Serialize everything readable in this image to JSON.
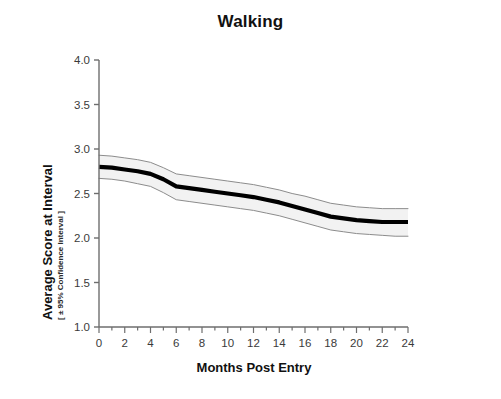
{
  "chart_data": {
    "type": "line",
    "title": "Walking",
    "xlabel": "Months Post Entry",
    "ylabel": "Average Score at Interval",
    "ylabel_sub": "[ ± 95% Confidence Interval ]",
    "xlim": [
      0,
      24
    ],
    "ylim": [
      1.0,
      4.0
    ],
    "xticks": [
      0,
      2,
      4,
      6,
      8,
      10,
      12,
      14,
      16,
      18,
      20,
      22,
      24
    ],
    "xtick_labels": [
      "0",
      "2",
      "4",
      "6",
      "8",
      "10",
      "12",
      "14",
      "16",
      "18",
      "20",
      "22",
      "24"
    ],
    "yticks": [
      1.0,
      1.5,
      2.0,
      2.5,
      3.0,
      3.5,
      4.0
    ],
    "ytick_labels": [
      "1.0",
      "1.5",
      "2.0",
      "2.5",
      "3.0",
      "3.5",
      "4.0"
    ],
    "x_minor_tick_step": 1,
    "grid": false,
    "legend": "none",
    "x": [
      0,
      1,
      2,
      3,
      4,
      5,
      6,
      7,
      8,
      9,
      10,
      11,
      12,
      13,
      14,
      15,
      16,
      17,
      18,
      19,
      20,
      21,
      22,
      23,
      24
    ],
    "series": [
      {
        "name": "Average Score at Interval",
        "style": "solid-thick-black",
        "color": "#000000",
        "values": [
          2.8,
          2.79,
          2.77,
          2.75,
          2.72,
          2.66,
          2.58,
          2.56,
          2.54,
          2.52,
          2.5,
          2.48,
          2.46,
          2.43,
          2.4,
          2.36,
          2.32,
          2.28,
          2.24,
          2.22,
          2.2,
          2.19,
          2.18,
          2.18,
          2.18
        ]
      },
      {
        "name": "95% CI upper",
        "style": "thin-gray",
        "color": "#8c8c8c",
        "values": [
          2.93,
          2.92,
          2.9,
          2.88,
          2.85,
          2.79,
          2.72,
          2.7,
          2.68,
          2.66,
          2.64,
          2.62,
          2.6,
          2.57,
          2.54,
          2.5,
          2.47,
          2.43,
          2.39,
          2.37,
          2.35,
          2.34,
          2.33,
          2.33,
          2.33
        ]
      },
      {
        "name": "95% CI lower",
        "style": "thin-gray",
        "color": "#8c8c8c",
        "values": [
          2.67,
          2.66,
          2.64,
          2.61,
          2.58,
          2.51,
          2.43,
          2.41,
          2.39,
          2.37,
          2.35,
          2.33,
          2.31,
          2.28,
          2.25,
          2.21,
          2.17,
          2.13,
          2.09,
          2.07,
          2.05,
          2.04,
          2.03,
          2.02,
          2.02
        ]
      }
    ],
    "colors": {
      "mean_line": "#000000",
      "ci_line": "#8c8c8c",
      "ci_fill": "#f2f2f2",
      "axis": "#6e6e6e",
      "text": "#111111",
      "background": "#ffffff"
    }
  }
}
